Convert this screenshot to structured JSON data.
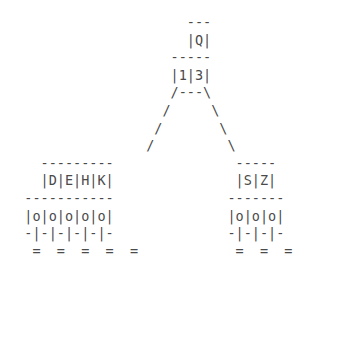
{
  "diagram": {
    "kind": "ascii-art-btree-index",
    "text_color": "#4a4a4a",
    "background_color": "#ffffff",
    "root_node": {
      "top_border": "---",
      "key_row": "|Q|",
      "bottom_border": "-----",
      "pointer_row": "|1|3|",
      "branch_row": "/---\\",
      "keys": [
        "Q"
      ],
      "pointers": [
        "1",
        "3"
      ]
    },
    "left_leaf": {
      "top_border": "---------",
      "key_row": "|D|E|H|K|",
      "bottom_border": "-----------",
      "record_row": "|o|o|o|o|o|",
      "stem_row": "-|-|-|-|-|-",
      "anchor_row": "=  =  =  =  =",
      "keys": [
        "D",
        "E",
        "H",
        "K"
      ],
      "record_count": 5,
      "anchor_count": 5
    },
    "right_leaf": {
      "top_border": "-----",
      "key_row": "|S|Z|",
      "bottom_border": "-------",
      "record_row": "|o|o|o|",
      "stem_row": "-|-|-|-",
      "anchor_row": "=  =  =",
      "keys": [
        "S",
        "Z"
      ],
      "record_count": 3,
      "anchor_count": 3
    },
    "connectors": {
      "left_branch_rows": [
        "/",
        "/",
        "/"
      ],
      "right_branch_rows": [
        "\\",
        "\\",
        "\\"
      ]
    },
    "lines": [
      "                      ---",
      "                      |Q|",
      "                    -----",
      "                    |1|3|",
      "                    /---\\",
      "                   /     \\",
      "                  /       \\",
      "                 /         \\",
      "    ---------               -----",
      "    |D|E|H|K|               |S|Z|",
      "  -----------              -------",
      "  |o|o|o|o|o|              |o|o|o|",
      "  -|-|-|-|-|-              -|-|-|-",
      "   =  =  =  =  =            =  =  ="
    ]
  }
}
